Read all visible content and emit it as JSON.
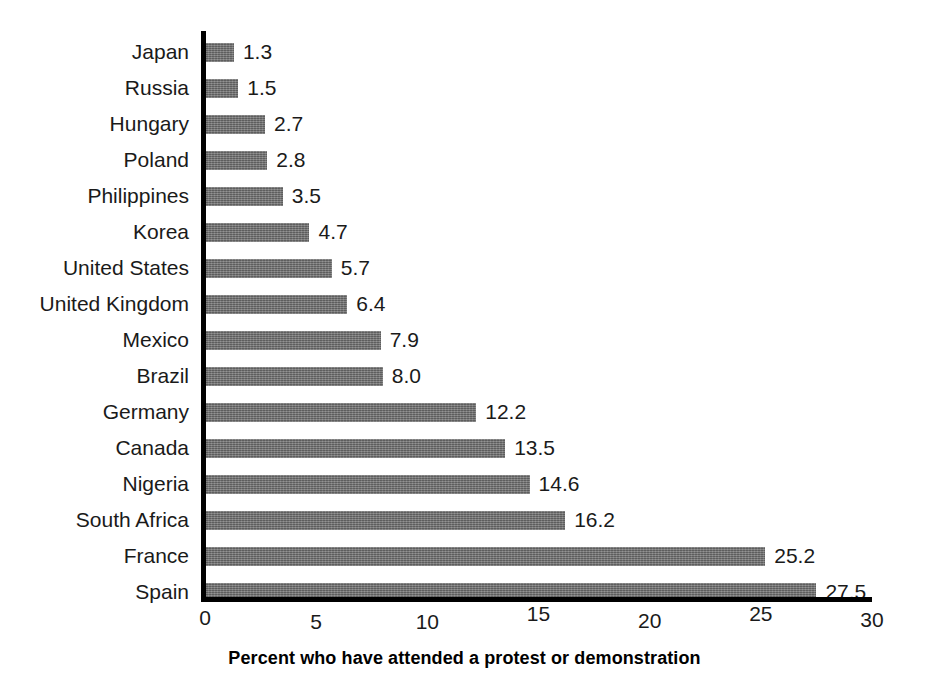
{
  "chart_data": {
    "type": "bar",
    "orientation": "horizontal",
    "title": "",
    "subtitle": "",
    "xlabel": "Percent who have attended a protest or demonstration",
    "ylabel": "",
    "xlim": [
      0,
      30
    ],
    "xticks": [
      "0",
      "5",
      "10",
      "15",
      "20",
      "25",
      "30"
    ],
    "xtick_values": [
      0,
      5,
      10,
      15,
      20,
      25,
      30
    ],
    "grid": false,
    "legend": null,
    "bar_color": "#6f6f6f",
    "axis_color": "#000000",
    "categories": [
      "Japan",
      "Russia",
      "Hungary",
      "Poland",
      "Philippines",
      "Korea",
      "United States",
      "United Kingdom",
      "Mexico",
      "Brazil",
      "Germany",
      "Canada",
      "Nigeria",
      "South Africa",
      "France",
      "Spain"
    ],
    "values": [
      1.3,
      1.5,
      2.7,
      2.8,
      3.5,
      4.7,
      5.7,
      6.4,
      7.9,
      8.0,
      12.2,
      13.5,
      14.6,
      16.2,
      25.2,
      27.5
    ],
    "value_labels": [
      "1.3",
      "1.5",
      "2.7",
      "2.8",
      "3.5",
      "4.7",
      "5.7",
      "6.4",
      "7.9",
      "8.0",
      "12.2",
      "13.5",
      "14.6",
      "16.2",
      "25.2",
      "27.5"
    ]
  }
}
